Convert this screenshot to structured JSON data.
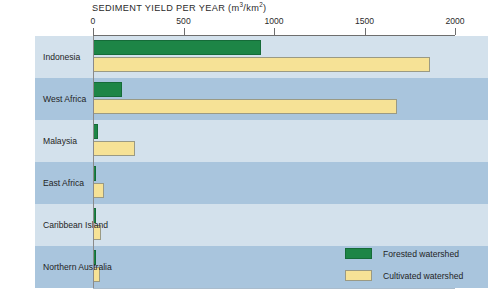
{
  "chart_data": {
    "type": "bar",
    "orientation": "horizontal",
    "title": "SEDIMENT YIELD PER YEAR (m3/km2)",
    "title_main": "SEDIMENT YIELD PER YEAR (m",
    "title_sup1": "3",
    "title_mid": "/km",
    "title_sup2": "2",
    "title_end": ")",
    "xlabel": "",
    "ylabel": "",
    "xlim": [
      0,
      2000
    ],
    "xticks": [
      0,
      500,
      1000,
      1500,
      2000
    ],
    "xtick_labels": [
      "0",
      "500",
      "1000",
      "1500",
      "2000"
    ],
    "grid": false,
    "legend_position": "inside-right",
    "categories": [
      "Indonesia",
      "West Africa",
      "Malaysia",
      "East Africa",
      "Caribbean Island",
      "Northern Australia"
    ],
    "series": [
      {
        "name": "Forested watershed",
        "color": "#1d8546",
        "values": [
          930,
          160,
          25,
          12,
          10,
          8
        ]
      },
      {
        "name": "Cultivated watershed",
        "color": "#f6e296",
        "values": [
          1860,
          1680,
          230,
          60,
          42,
          40
        ]
      }
    ]
  },
  "legend": {
    "items": [
      {
        "label": "Forested watershed",
        "color": "#1d8546"
      },
      {
        "label": "Cultivated watershed",
        "color": "#f6e296"
      }
    ]
  },
  "colors": {
    "forested": "#1d8546",
    "cultivated": "#f6e296",
    "band_light": "#d3e1ec",
    "band_dark": "#a9c5dd",
    "panel": "#d2e0ea",
    "axis": "#6e6e6e",
    "text": "#1f1f1f"
  }
}
